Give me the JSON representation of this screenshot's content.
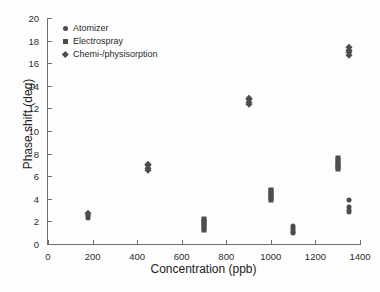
{
  "chart_data": {
    "type": "scatter",
    "title": "",
    "xlabel": "Concentration (ppb)",
    "ylabel": "Phase shift (deg)",
    "xlim": [
      0,
      1400
    ],
    "ylim": [
      0,
      20
    ],
    "xticks": [
      0,
      200,
      400,
      600,
      800,
      1000,
      1200,
      1400
    ],
    "yticks": [
      0,
      2,
      4,
      6,
      8,
      10,
      12,
      14,
      16,
      18,
      20
    ],
    "grid": false,
    "legend_position": "upper left",
    "marker_color": "#4d4d4d",
    "series": [
      {
        "name": "Atomizer",
        "marker": "circle",
        "points": [
          [
            180,
            2.3
          ],
          [
            180,
            2.45
          ],
          [
            180,
            2.6
          ],
          [
            1100,
            0.95
          ],
          [
            1100,
            1.1
          ],
          [
            1100,
            1.25
          ],
          [
            1100,
            1.45
          ],
          [
            1100,
            1.6
          ],
          [
            1350,
            2.85
          ],
          [
            1350,
            3.05
          ],
          [
            1350,
            3.25
          ],
          [
            1350,
            3.9
          ]
        ]
      },
      {
        "name": "Electrospray",
        "marker": "square",
        "points": [
          [
            700,
            1.25
          ],
          [
            700,
            1.45
          ],
          [
            700,
            1.65
          ],
          [
            700,
            1.85
          ],
          [
            700,
            2.05
          ],
          [
            700,
            2.25
          ],
          [
            1000,
            3.85
          ],
          [
            1000,
            4.05
          ],
          [
            1000,
            4.25
          ],
          [
            1000,
            4.45
          ],
          [
            1000,
            4.65
          ],
          [
            1000,
            4.8
          ],
          [
            1300,
            6.6
          ],
          [
            1300,
            6.8
          ],
          [
            1300,
            7.0
          ],
          [
            1300,
            7.2
          ],
          [
            1300,
            7.45
          ],
          [
            1300,
            7.65
          ]
        ]
      },
      {
        "name": "Chemi-/physisorption",
        "marker": "diamond",
        "points": [
          [
            180,
            2.75
          ],
          [
            450,
            6.55
          ],
          [
            450,
            6.75
          ],
          [
            450,
            6.95
          ],
          [
            450,
            7.1
          ],
          [
            900,
            12.35
          ],
          [
            900,
            12.55
          ],
          [
            900,
            12.8
          ],
          [
            900,
            12.95
          ],
          [
            1350,
            16.75
          ],
          [
            1350,
            16.95
          ],
          [
            1350,
            17.2
          ],
          [
            1350,
            17.45
          ]
        ]
      }
    ]
  }
}
